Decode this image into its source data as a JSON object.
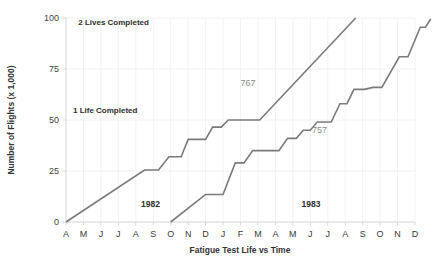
{
  "chart_data": {
    "type": "line",
    "title": "",
    "xlabel": "Fatigue Test Life vs Time",
    "ylabel": "Number of Flights (x 1,000)",
    "ylim": [
      0,
      100
    ],
    "yticks": [
      0,
      25,
      50,
      75,
      100
    ],
    "ytick_labels": [
      "0",
      "25",
      "50",
      "75",
      "100"
    ],
    "grid": true,
    "legend": "inline-annotations",
    "x": [
      "A",
      "M",
      "J",
      "J",
      "A",
      "S",
      "O",
      "N",
      "D",
      "J",
      "F",
      "M",
      "A",
      "M",
      "J",
      "J",
      "A",
      "S",
      "O",
      "N",
      "D"
    ],
    "xtick_labels": [
      "A",
      "M",
      "J",
      "J",
      "A",
      "S",
      "O",
      "N",
      "D",
      "J",
      "F",
      "M",
      "A",
      "M",
      "J",
      "J",
      "A",
      "S",
      "O",
      "N",
      "D"
    ],
    "series": [
      {
        "name": "767",
        "label": "767",
        "color": "#7a7a7a",
        "points": [
          [
            0,
            0
          ],
          [
            4.5,
            25.5
          ],
          [
            5.3,
            25.5
          ],
          [
            5.9,
            32
          ],
          [
            6.6,
            32
          ],
          [
            7.0,
            40.5
          ],
          [
            8.0,
            40.5
          ],
          [
            8.4,
            46.5
          ],
          [
            8.9,
            46.5
          ],
          [
            9.3,
            50
          ],
          [
            11.1,
            50
          ],
          [
            16.6,
            100
          ]
        ]
      },
      {
        "name": "757",
        "label": "757",
        "color": "#7a7a7a",
        "points": [
          [
            6,
            0
          ],
          [
            8.0,
            13.5
          ],
          [
            9.0,
            13.5
          ],
          [
            9.7,
            29
          ],
          [
            10.2,
            29
          ],
          [
            10.7,
            35
          ],
          [
            12.2,
            35
          ],
          [
            12.7,
            41
          ],
          [
            13.2,
            41
          ],
          [
            13.6,
            45
          ],
          [
            14.0,
            45
          ],
          [
            14.4,
            49
          ],
          [
            15.2,
            49
          ],
          [
            15.7,
            58
          ],
          [
            16.1,
            58
          ],
          [
            16.5,
            65
          ],
          [
            17.1,
            65
          ],
          [
            17.6,
            66
          ],
          [
            18.1,
            66
          ],
          [
            19.1,
            81
          ],
          [
            19.6,
            81
          ],
          [
            20.3,
            95.5
          ],
          [
            20.6,
            95.5
          ],
          [
            20.9,
            99.5
          ]
        ]
      }
    ],
    "annotations": [
      {
        "text": "2 Lives Completed",
        "x_index": 0.7,
        "y_value": 96.5,
        "name": "two-lives-completed-label"
      },
      {
        "text": "1 Life Completed",
        "x_index": 0.4,
        "y_value": 53.5,
        "name": "one-life-completed-label"
      },
      {
        "text": "1982",
        "x_index": 4.3,
        "y_value": 7.5,
        "name": "year-1982-label"
      },
      {
        "text": "1983",
        "x_index": 13.5,
        "y_value": 7.5,
        "name": "year-1983-label"
      },
      {
        "text": "767",
        "x_index": 10.0,
        "y_value": 66.5,
        "name": "series-label-767"
      },
      {
        "text": "757",
        "x_index": 14.1,
        "y_value": 43.5,
        "name": "series-label-757"
      }
    ]
  }
}
